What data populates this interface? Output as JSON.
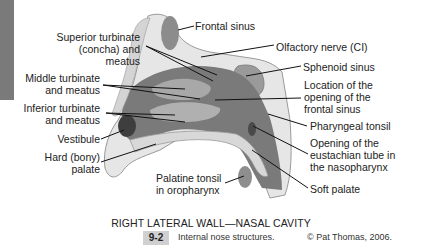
{
  "figure": {
    "title": "RIGHT LATERAL WALL—NASAL CAVITY",
    "number": "9-2",
    "description": "Internal nose structures.",
    "copyright": "© Pat Thomas, 2006."
  },
  "labels": {
    "frontal_sinus": "Frontal sinus",
    "superior_turbinate": [
      "Superior turbinate",
      "(concha) and",
      "meatus"
    ],
    "olfactory_nerve": "Olfactory nerve (CI)",
    "sphenoid_sinus": "Sphenoid sinus",
    "middle_turbinate": [
      "Middle turbinate",
      "and meatus"
    ],
    "location_opening": [
      "Location of the",
      "opening of the",
      "frontal sinus"
    ],
    "inferior_turbinate": [
      "Inferior turbinate",
      "and meatus"
    ],
    "pharyngeal_tonsil": "Pharyngeal tonsil",
    "vestibule": "Vestibule",
    "eustachian_tube": [
      "Opening of the",
      "eustachian tube in",
      "the nasopharynx"
    ],
    "hard_palate": [
      "Hard (bony)",
      "palate"
    ],
    "palatine_tonsil": [
      "Palatine tonsil",
      "in oropharynx"
    ],
    "soft_palate": "Soft palate"
  },
  "colors": {
    "side_bar": "#7a7a7a",
    "badge_bg": "#d0d0d0",
    "tissue_dark": "#6e6e6e",
    "tissue_mid": "#a5a5a5",
    "bone_light": "#e3e3e3"
  }
}
